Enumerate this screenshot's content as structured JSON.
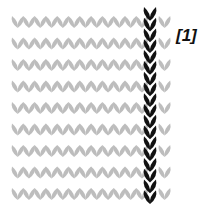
{
  "diagram": {
    "label": "[1]",
    "rows": 9,
    "gray_columns": 14,
    "highlighted_column_index": 11,
    "colors": {
      "gray_stitch": "#bdbdbd",
      "highlight_stitch": "#111111",
      "background": "#ffffff"
    },
    "geometry": {
      "start_x": 12,
      "stitch_width": 11.3,
      "start_y": 16,
      "row_height": 21.5,
      "highlight_x": 150,
      "highlight_top": 7,
      "highlight_bottom": 201,
      "highlight_vs": 18
    }
  }
}
